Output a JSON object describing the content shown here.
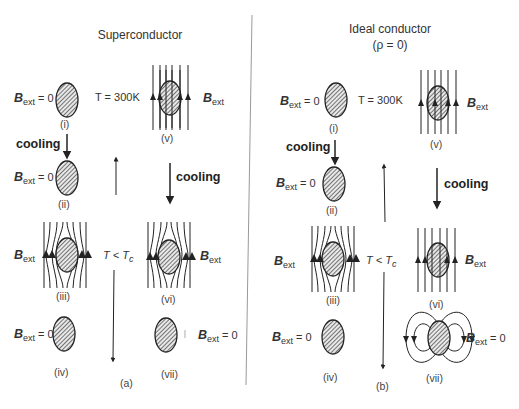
{
  "panels": [
    {
      "title": "Superconductor",
      "subtitle": "",
      "caption": "(a)",
      "states": [
        {
          "id": "i",
          "label": "(i)",
          "field": "= 0",
          "condition": "T = 300K"
        },
        {
          "id": "ii",
          "label": "(ii)",
          "field": "= 0"
        },
        {
          "id": "iii",
          "label": "(iii)",
          "field": ""
        },
        {
          "id": "iv",
          "label": "(iv)",
          "field": "= 0"
        },
        {
          "id": "v",
          "label": "(v)",
          "field": ""
        },
        {
          "id": "vi",
          "label": "(vi)",
          "field": ""
        },
        {
          "id": "vii",
          "label": "(vii)",
          "field": "= 0"
        }
      ],
      "cooling_label": "cooling",
      "temp_axis_label": "T < T",
      "temp_axis_sub": "c"
    },
    {
      "title": "Ideal conductor",
      "subtitle": "(ρ = 0)",
      "caption": "(b)",
      "states": [
        {
          "id": "i",
          "label": "(i)",
          "field": "= 0",
          "condition": "T = 300K"
        },
        {
          "id": "ii",
          "label": "(ii)",
          "field": "= 0"
        },
        {
          "id": "iii",
          "label": "(iii)",
          "field": ""
        },
        {
          "id": "iv",
          "label": "(iv)",
          "field": "= 0"
        },
        {
          "id": "v",
          "label": "(v)",
          "field": ""
        },
        {
          "id": "vi",
          "label": "(vi)",
          "field": ""
        },
        {
          "id": "vii",
          "label": "(vii)",
          "field": "= 0"
        }
      ],
      "cooling_label": "cooling",
      "temp_axis_label": "T < T",
      "temp_axis_sub": "c"
    }
  ],
  "symbols": {
    "B": "B",
    "ext": "ext"
  }
}
